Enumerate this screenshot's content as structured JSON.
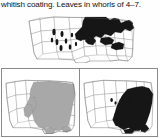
{
  "caption": {
    "text": "whitish coating. Leaves in whorls of 4–7."
  },
  "figure": {
    "kind": "species-range-maps",
    "map_count": 3,
    "base_map": "united-states-lower-48",
    "colors": {
      "range_solid": "#161616",
      "range_shaded": "#a8a8a8",
      "state_outline": "#6f6f6f",
      "panel_border": "#8a8a8a",
      "background": "#ffffff"
    }
  },
  "maps": [
    {
      "id": "map-top",
      "position": "top",
      "symbology": "solid-black",
      "description": "Range covers the Great Lakes, Upper Midwest and Northeast, extending west across the northern Plains, with isolated spots in the Intermountain West.",
      "range_states": [
        "Minnesota",
        "Wisconsin",
        "Michigan",
        "Illinois",
        "Indiana",
        "Ohio",
        "Pennsylvania",
        "New York",
        "Vermont",
        "New Hampshire",
        "Maine",
        "Massachusetts",
        "Connecticut",
        "Rhode Island",
        "New Jersey",
        "North Dakota",
        "South Dakota",
        "Iowa",
        "Missouri",
        "West Virginia",
        "Maryland",
        "Delaware"
      ],
      "outlier_spots": [
        "Washington",
        "Idaho",
        "Montana",
        "Wyoming",
        "Utah",
        "Nevada",
        "Colorado",
        "Arizona",
        "New Mexico"
      ]
    },
    {
      "id": "map-bottom-left",
      "position": "bottom-left",
      "symbology": "gray-shaded",
      "description": "Shaded range spans the entire eastern United States from the Great Plains to the Atlantic coast, including the Gulf states.",
      "range_states": [
        "Minnesota",
        "Iowa",
        "Missouri",
        "Arkansas",
        "Louisiana",
        "Mississippi",
        "Alabama",
        "Georgia",
        "Florida",
        "South Carolina",
        "North Carolina",
        "Virginia",
        "Tennessee",
        "Kentucky",
        "Illinois",
        "Wisconsin",
        "Michigan",
        "Indiana",
        "Ohio",
        "West Virginia",
        "Pennsylvania",
        "New York",
        "New Jersey",
        "Maryland",
        "Delaware",
        "Connecticut",
        "Rhode Island",
        "Massachusetts",
        "Vermont",
        "New Hampshire",
        "Maine",
        "Texas",
        "Oklahoma",
        "Kansas"
      ]
    },
    {
      "id": "map-bottom-right",
      "position": "bottom-right",
      "symbology": "solid-black",
      "description": "Solid range concentrated in the Southeast and lower Midwest, from eastern Texas and Missouri east to the Atlantic and north into the Appalachians.",
      "range_states": [
        "Missouri",
        "Arkansas",
        "Louisiana",
        "Mississippi",
        "Alabama",
        "Georgia",
        "Florida",
        "South Carolina",
        "North Carolina",
        "Virginia",
        "Tennessee",
        "Kentucky",
        "Illinois",
        "Indiana",
        "Ohio",
        "West Virginia",
        "Pennsylvania",
        "Maryland",
        "Delaware",
        "New Jersey",
        "Texas",
        "Oklahoma"
      ]
    }
  ]
}
